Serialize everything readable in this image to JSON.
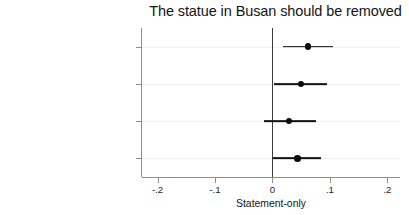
{
  "chart_data": {
    "type": "scatter",
    "title": "The statue in Busan should be removed",
    "xlabel": "Statement-only",
    "ylabel": "",
    "grid": true,
    "legend": null,
    "xlim": [
      -0.227,
      0.222
    ],
    "xticks": [
      -0.2,
      -0.1,
      0,
      0.1,
      0.2
    ],
    "xticklabels": [
      "-.2",
      "-.1",
      "0",
      ".1",
      ".2"
    ],
    "zero_reference_line": 0,
    "orientation": "horizontal",
    "categories": [
      "Control (no texts provided)",
      "US supports JP",
      "US supports ROK",
      "US supports JP-ROK pact"
    ],
    "values": [
      0.062,
      0.05,
      0.029,
      0.044
    ],
    "ci_low": [
      0.019,
      0.002,
      -0.015,
      0.001
    ],
    "ci_high": [
      0.105,
      0.095,
      0.076,
      0.084
    ],
    "points": [
      {
        "label": "Control (no texts provided)",
        "estimate": 0.062,
        "ci_low": 0.019,
        "ci_high": 0.105
      },
      {
        "label": "US supports JP",
        "estimate": 0.05,
        "ci_low": 0.002,
        "ci_high": 0.095
      },
      {
        "label": "US supports ROK",
        "estimate": 0.029,
        "ci_low": -0.015,
        "ci_high": 0.076
      },
      {
        "label": "US supports JP-ROK pact",
        "estimate": 0.044,
        "ci_low": 0.001,
        "ci_high": 0.084
      }
    ],
    "colors": {
      "marker": "#0b0b0b",
      "ci": "#111111",
      "zero_line": "#3a3a3a",
      "grid": "#f1f1f1",
      "axis": "#8d8d8d",
      "background": "#ffffff"
    }
  }
}
